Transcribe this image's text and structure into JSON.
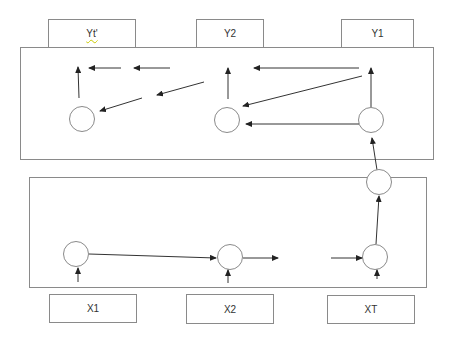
{
  "diagram": {
    "type": "encoder-decoder-rnn",
    "colors": {
      "stroke": "#8a8a8a",
      "arrow": "#222222",
      "text": "#333333",
      "background": "#ffffff"
    },
    "output_labels": [
      {
        "id": "yt",
        "label": "Yt'"
      },
      {
        "id": "y2",
        "label": "Y2"
      },
      {
        "id": "y1",
        "label": "Y1"
      }
    ],
    "input_labels": [
      {
        "id": "x1",
        "label": "X1"
      },
      {
        "id": "x2",
        "label": "X2"
      },
      {
        "id": "xt",
        "label": "XT"
      }
    ],
    "decoder_box": {
      "name": "decoder",
      "nodes": 3
    },
    "encoder_box": {
      "name": "encoder",
      "nodes": 3
    },
    "context_node": {
      "name": "context-vector"
    }
  }
}
